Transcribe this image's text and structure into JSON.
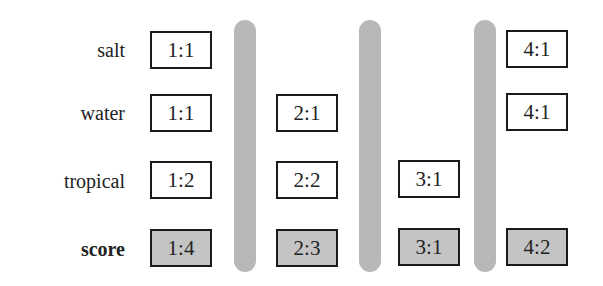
{
  "rows": [
    {
      "label": "salt",
      "bold": false
    },
    {
      "label": "water",
      "bold": false
    },
    {
      "label": "tropical",
      "bold": false
    },
    {
      "label": "score",
      "bold": true
    }
  ],
  "columns": [
    {
      "cells": [
        "1:1",
        "1:1",
        "1:2",
        "1:4"
      ]
    },
    {
      "cells": [
        null,
        "2:1",
        "2:2",
        "2:3"
      ]
    },
    {
      "cells": [
        null,
        null,
        "3:1",
        "3:1"
      ]
    },
    {
      "cells": [
        "4:1",
        "4:1",
        null,
        "4:2"
      ]
    }
  ],
  "colors": {
    "box_border": "#1a1a1a",
    "score_fill": "#c4c4c4",
    "separator": "#b8b8b8"
  }
}
